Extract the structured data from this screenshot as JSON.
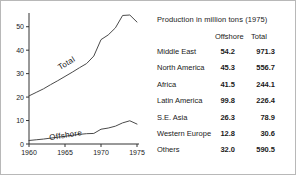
{
  "chart_data": {
    "type": "line",
    "title": "",
    "xlabel": "",
    "ylabel": "",
    "xlim": [
      1960,
      1975
    ],
    "ylim": [
      0,
      55
    ],
    "yticks": [
      0,
      10,
      20,
      30,
      40,
      50
    ],
    "ytick_labels": [
      "0",
      "10",
      "20",
      "30",
      "40",
      "50"
    ],
    "xticks": [
      1960,
      1965,
      1970,
      1975
    ],
    "xtick_labels": [
      "1960",
      "1965",
      "1970",
      "1975"
    ],
    "grid": false,
    "legend_position": "inline",
    "series": [
      {
        "name": "Total",
        "label": "Total",
        "x": [
          1960,
          1961,
          1962,
          1963,
          1964,
          1965,
          1966,
          1967,
          1968,
          1969,
          1970,
          1971,
          1972,
          1973,
          1974,
          1975
        ],
        "values": [
          20.5,
          22.0,
          23.5,
          25.3,
          27.0,
          28.8,
          30.6,
          32.5,
          34.3,
          37.5,
          44.5,
          46.5,
          49.5,
          54.8,
          55.0,
          52.0
        ]
      },
      {
        "name": "Offshore",
        "label": "Offshore",
        "x": [
          1960,
          1961,
          1962,
          1963,
          1964,
          1965,
          1966,
          1967,
          1968,
          1969,
          1970,
          1971,
          1972,
          1973,
          1974,
          1975
        ],
        "values": [
          1.5,
          1.8,
          2.1,
          2.5,
          2.9,
          3.3,
          3.7,
          4.1,
          4.4,
          4.5,
          6.3,
          6.8,
          7.6,
          9.0,
          9.9,
          8.5
        ]
      }
    ]
  },
  "table": {
    "title": "Production in million tons (1975)",
    "columns": [
      "Offshore",
      "Total"
    ],
    "rows": [
      {
        "region": "Middle East",
        "offshore": "54.2",
        "total": "971.3"
      },
      {
        "region": "North America",
        "offshore": "45.3",
        "total": "556.7"
      },
      {
        "region": "Africa",
        "offshore": "41.5",
        "total": "244.1"
      },
      {
        "region": "Latin America",
        "offshore": "99.8",
        "total": "226.4"
      },
      {
        "region": "S.E. Asia",
        "offshore": "26.3",
        "total": "78.9"
      },
      {
        "region": "Western Europe",
        "offshore": "12.8",
        "total": "30.6"
      },
      {
        "region": "Others",
        "offshore": "32.0",
        "total": "590.5"
      }
    ]
  },
  "colors": {
    "line": "#4a4a4a",
    "axis": "#333333",
    "border": "#b8b8b8",
    "text": "#1a1a1a",
    "background": "#ffffff"
  }
}
